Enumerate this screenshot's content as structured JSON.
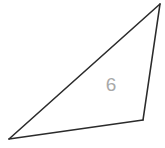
{
  "figure": {
    "kind": "geometry-triangle",
    "canvas": {
      "width": 165,
      "height": 148,
      "background_color": "#ffffff"
    },
    "style": {
      "stroke_color": "#2b2b2b",
      "stroke_width": 1.6,
      "label_color": "#a9a9a9",
      "label_font_size": 19
    },
    "vertices": [
      {
        "id": "apex",
        "name": "top-right-vertex",
        "x": 160,
        "y": 4
      },
      {
        "id": "lower_right",
        "name": "bottom-right-vertex",
        "x": 143,
        "y": 120
      },
      {
        "id": "lower_left",
        "name": "bottom-left-vertex",
        "x": 9,
        "y": 139
      }
    ],
    "sides": [
      {
        "id": "right_side",
        "name": "right-side",
        "from": "apex",
        "to": "lower_right"
      },
      {
        "id": "bottom_side",
        "name": "bottom-side",
        "from": "lower_right",
        "to": "lower_left"
      },
      {
        "id": "hypotenuse",
        "name": "long-side",
        "from": "lower_left",
        "to": "apex"
      }
    ],
    "labels": [
      {
        "id": "interior_measure",
        "name": "interior-measure-label",
        "text": "6",
        "x": 111,
        "y": 86,
        "color": "#a9a9a9"
      }
    ]
  }
}
